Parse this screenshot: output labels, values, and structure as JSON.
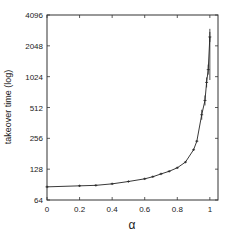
{
  "chart_data": {
    "type": "line",
    "title": "",
    "xlabel": "α",
    "ylabel": "takeover time (log)",
    "y_scale": "log2",
    "xlim": [
      0,
      1.05
    ],
    "ylim": [
      64,
      4096
    ],
    "x_ticks": [
      0,
      0.2,
      0.4,
      0.6,
      0.8,
      1
    ],
    "x_tick_labels": [
      "0",
      "0.2",
      "0.4",
      "0.6",
      "0.8",
      "1"
    ],
    "y_ticks": [
      64,
      128,
      256,
      512,
      1024,
      2048,
      4096
    ],
    "y_tick_labels": [
      "64",
      "128",
      "256",
      "512",
      "1024",
      "2048",
      "4096"
    ],
    "grid": false,
    "legend": null,
    "series": [
      {
        "name": "takeover time",
        "x": [
          0,
          0.2,
          0.3,
          0.4,
          0.5,
          0.6,
          0.65,
          0.7,
          0.75,
          0.8,
          0.85,
          0.9,
          0.92,
          0.95,
          0.97,
          0.98,
          0.99,
          1.0
        ],
        "values": [
          86,
          88,
          89,
          92,
          97,
          103,
          108,
          115,
          122,
          132,
          150,
          198,
          240,
          435,
          600,
          900,
          1200,
          2500
        ],
        "error_bars": true
      }
    ]
  },
  "labels": {
    "xlabel": "α",
    "ylabel": "takeover time (log)"
  }
}
